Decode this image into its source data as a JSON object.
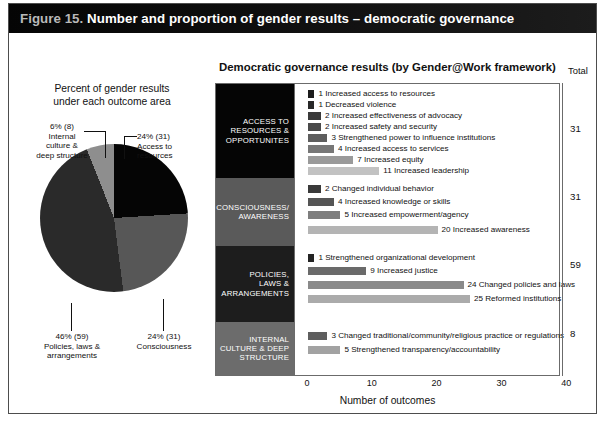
{
  "figure": {
    "number_label": "Figure 15.",
    "title": "Number and proportion of gender results – democratic governance"
  },
  "pie_panel": {
    "title_line1": "Percent of gender results",
    "title_line2": "under each outcome area",
    "labels": {
      "internal": "6% (8)\nInternal\nculture  &\ndeep structure",
      "access": "24% (31)\nAccess to\nresources",
      "policies": "46% (59)\nPolicies, laws &\narrangements",
      "consciousness": "24% (31)\nConsciousness"
    }
  },
  "bar_panel": {
    "title": "Democratic governance results (by Gender@Work framework)",
    "total_header": "Total",
    "axis_title": "Number of outcomes"
  },
  "footer": {
    "source": ""
  },
  "colors": {
    "title_bar": "#0a0a0a",
    "pie_access": "#050505",
    "pie_consciousness": "#575757",
    "pie_policies": "#2a2a2a",
    "pie_internal": "#8e8e8e",
    "cat_block_0": "#050505",
    "cat_block_1": "#5a5a5a",
    "cat_block_2": "#1d1d1d",
    "cat_block_3": "#6c6c6c"
  },
  "chart_data": {
    "type": "bar",
    "title": "Democratic governance results (by Gender@Work framework)",
    "xlabel": "Number of outcomes",
    "ylabel": "",
    "xlim": [
      0,
      52
    ],
    "xticks": [
      0,
      10,
      20,
      30,
      40,
      50
    ],
    "grid": false,
    "legend": "none",
    "orientation": "horizontal",
    "groups": [
      {
        "name": "ACCESS TO\nRESOURCES &\nOPPORTUNITES",
        "total": 31,
        "block_color": "#050505",
        "items": [
          {
            "label": "Increased access to resources",
            "value": 1,
            "color": "#1c1c1c"
          },
          {
            "label": "Decreased violence",
            "value": 1,
            "color": "#282828"
          },
          {
            "label": "Increased effectiveness of advocacy",
            "value": 2,
            "color": "#3a3a3a"
          },
          {
            "label": "Increased safety and security",
            "value": 2,
            "color": "#4a4a4a"
          },
          {
            "label": "Strengthened power to influence institutions",
            "value": 3,
            "color": "#5e5e5e"
          },
          {
            "label": "Increased access to services",
            "value": 4,
            "color": "#777777"
          },
          {
            "label": "Increased equity",
            "value": 7,
            "color": "#9a9a9a"
          },
          {
            "label": "Increased leadership",
            "value": 11,
            "color": "#c2c2c2"
          }
        ]
      },
      {
        "name": "CONSCIOUSNESS/\nAWARENESS",
        "total": 31,
        "block_color": "#5a5a5a",
        "items": [
          {
            "label": "Changed individual behavior",
            "value": 2,
            "color": "#3a3a3a"
          },
          {
            "label": "Increased knowledge or skills",
            "value": 4,
            "color": "#555555"
          },
          {
            "label": "Increased empowerment/agency",
            "value": 5,
            "color": "#7e7e7e"
          },
          {
            "label": "Increased awareness",
            "value": 20,
            "color": "#b4b4b4"
          }
        ]
      },
      {
        "name": "POLICIES,\nLAWS &\nARRANGEMENTS",
        "total": 59,
        "block_color": "#1d1d1d",
        "items": [
          {
            "label": "Strengthened organizational development",
            "value": 1,
            "color": "#242424"
          },
          {
            "label": "Increased justice",
            "value": 9,
            "color": "#6a6a6a"
          },
          {
            "label": "Changed policies and laws",
            "value": 24,
            "color": "#8a8a8a"
          },
          {
            "label": "Reformed institutions",
            "value": 25,
            "color": "#ababab"
          }
        ]
      },
      {
        "name": "INTERNAL\nCULTURE & DEEP\nSTRUCTURE",
        "total": 8,
        "block_color": "#6c6c6c",
        "items": [
          {
            "label": "Changed traditional/community/religious practice or regulations",
            "value": 3,
            "color": "#5e5e5e"
          },
          {
            "label": "Strengthened transparency/accountability",
            "value": 5,
            "color": "#a2a2a2"
          }
        ]
      }
    ]
  },
  "pie_data": {
    "type": "pie",
    "title": "Percent of gender results under each outcome area",
    "slices": [
      {
        "label": "Access to resources",
        "percent": 24,
        "count": 31,
        "color": "#050505"
      },
      {
        "label": "Consciousness",
        "percent": 24,
        "count": 31,
        "color": "#575757"
      },
      {
        "label": "Policies, laws & arrangements",
        "percent": 46,
        "count": 59,
        "color": "#2a2a2a"
      },
      {
        "label": "Internal culture & deep structure",
        "percent": 6,
        "count": 8,
        "color": "#8e8e8e"
      }
    ]
  }
}
